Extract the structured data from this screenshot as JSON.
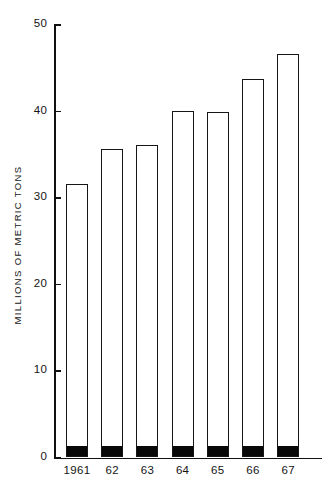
{
  "chart_data": {
    "type": "bar",
    "title": "",
    "subtitle": "",
    "xlabel": "",
    "ylabel": "MILLIONS OF METRIC TONS",
    "categories": [
      "1961",
      "62",
      "63",
      "64",
      "65",
      "66",
      "67"
    ],
    "values": [
      31.6,
      35.7,
      36.1,
      40.1,
      39.9,
      43.8,
      46.7
    ],
    "series": [
      {
        "name": "total",
        "values": [
          31.6,
          35.7,
          36.1,
          40.1,
          39.9,
          43.8,
          46.7
        ]
      },
      {
        "name": "filled-base-segment",
        "values": [
          1.2,
          1.2,
          1.2,
          1.2,
          1.2,
          1.2,
          1.2
        ]
      }
    ],
    "ylim": [
      0,
      50
    ],
    "xlim_note": "categorical",
    "yticks": [
      0,
      10,
      20,
      30,
      40,
      50
    ],
    "ytick_labels": [
      "0",
      "10",
      "20",
      "30",
      "40",
      "50"
    ],
    "grid": false,
    "legend": "none",
    "bar_style": {
      "fill": "#ffffff",
      "edge": "#161616",
      "base_segment_fill": "#080808"
    },
    "annotations": []
  },
  "colors": {
    "background": "#ffffff",
    "axis": "#111111",
    "text": "#141414",
    "bar_edge": "#161616",
    "bar_fill": "#ffffff",
    "bar_base_fill": "#080808"
  }
}
